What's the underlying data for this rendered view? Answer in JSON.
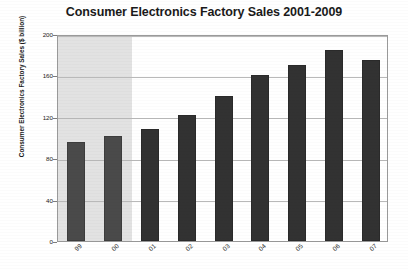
{
  "chart_data": {
    "type": "bar",
    "title": "Consumer Electronics Factory Sales 2001-2009",
    "xlabel": "",
    "ylabel": "Consumer Electronics Factory Sales ($ billion)",
    "categories": [
      "99",
      "00",
      "01",
      "02",
      "03",
      "04",
      "05",
      "06",
      "07"
    ],
    "values": [
      96,
      101,
      108,
      122,
      140,
      160,
      170,
      185,
      175
    ],
    "ylim": [
      0,
      200
    ],
    "yticks": [
      0,
      40,
      80,
      120,
      160,
      200
    ],
    "ytick_labels": [
      "0",
      "40",
      "80",
      "120",
      "160",
      "200"
    ],
    "grid": true,
    "legend": "none",
    "bar_color": "#323232",
    "shaded_region": {
      "categories": [
        "99",
        "00"
      ],
      "color": "#e2e2e2"
    }
  }
}
